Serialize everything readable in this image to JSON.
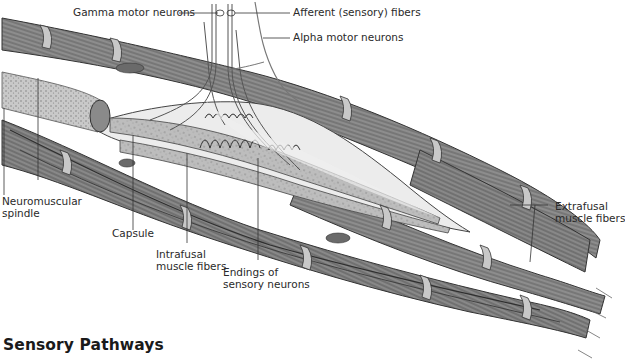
{
  "figure": {
    "labels": {
      "gamma_motor_neurons": "Gamma motor neurons",
      "afferent_fibers": "Afferent (sensory) fibers",
      "alpha_motor_neurons": "Alpha motor neurons",
      "neuromuscular_spindle": "Neuromuscular\nspindle",
      "capsule": "Capsule",
      "intrafusal_fibers": "Intrafusal\nmuscle fibers",
      "endings_sensory": "Endings of\nsensory neurons",
      "extrafusal_fibers": "Extrafusal\nmuscle fibers"
    },
    "colors": {
      "fiber_fill": "#9a9a9a",
      "fiber_dark": "#4a4a4a",
      "band_light": "#c4c4c4",
      "capsule_fill": "#e8e8e8",
      "nerve_stroke": "#555555",
      "background": "#ffffff"
    }
  },
  "section": {
    "title": "Sensory Pathways"
  }
}
